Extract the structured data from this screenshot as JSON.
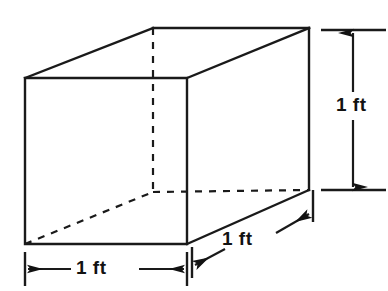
{
  "figure": {
    "shape": "cube",
    "stroke_color": "#1a1a1a",
    "background_color": "#ffffff",
    "dimension_labels": {
      "width": "1 ft",
      "depth": "1 ft",
      "height": "1 ft"
    },
    "unit": "ft",
    "edges": {
      "solid_description": "visible edges",
      "dashed_description": "hidden edges"
    }
  }
}
